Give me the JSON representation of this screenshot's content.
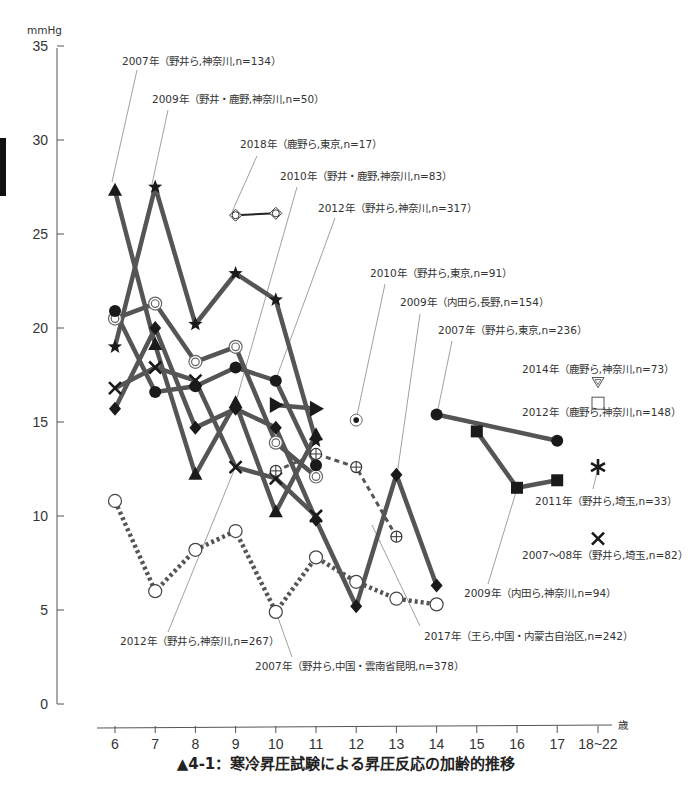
{
  "chart_data": {
    "type": "line",
    "title": "▲4-1：寒冷昇圧試験による昇圧反応の加齢的推移",
    "ylabel": "mmHg",
    "xlabel": "歳",
    "ylim": [
      0,
      35
    ],
    "yticks": [
      0,
      5,
      10,
      15,
      20,
      25,
      30,
      35
    ],
    "categories": [
      "6",
      "7",
      "8",
      "9",
      "10",
      "11",
      "12",
      "13",
      "14",
      "15",
      "16",
      "17",
      "18~22"
    ],
    "grid": false,
    "series": [
      {
        "name": "2007年（野井ら,神奈川,n=134）",
        "marker": "triangle",
        "style": "thick",
        "x": [
          6,
          7,
          8,
          9,
          10,
          11
        ],
        "values": [
          27.3,
          19.1,
          12.2,
          16.0,
          10.2,
          14.3
        ]
      },
      {
        "name": "2009年（野井・鹿野,神奈川,n=50）",
        "marker": "star",
        "style": "thick",
        "x": [
          6,
          7,
          8,
          9,
          10,
          11
        ],
        "values": [
          19.0,
          27.5,
          20.2,
          22.9,
          21.5,
          14.0
        ]
      },
      {
        "name": "2018年（鹿野ら,東京,n=17）",
        "marker": "diamond-open-cross",
        "style": "thin",
        "x": [
          9,
          10
        ],
        "values": [
          26.0,
          26.1
        ]
      },
      {
        "name": "2010年（野井・鹿野,神奈川,n=83）",
        "marker": "double-circle",
        "style": "thick",
        "x": [
          6,
          7,
          8,
          9,
          10,
          11
        ],
        "values": [
          20.5,
          21.3,
          18.2,
          19.0,
          13.9,
          12.1
        ]
      },
      {
        "name": "2012年（野井ら,神奈川,n=317）",
        "marker": "filled-circle",
        "style": "thick",
        "x": [
          6,
          7,
          8,
          9,
          10,
          11
        ],
        "values": [
          20.9,
          16.6,
          16.9,
          17.9,
          17.2,
          12.7
        ]
      },
      {
        "name": "2012年（野井ら,神奈川,n=267）",
        "marker": "x",
        "style": "thick",
        "x": [
          6,
          7,
          8,
          9,
          10,
          11
        ],
        "values": [
          16.8,
          17.9,
          17.2,
          12.6,
          12.0,
          10.0
        ]
      },
      {
        "name": "2009年（内田ら,長野,n=154）",
        "marker": "filled-diamond",
        "style": "thick",
        "x": [
          6,
          7,
          8,
          9,
          10,
          11,
          12,
          13,
          14
        ],
        "values": [
          15.7,
          20.0,
          14.7,
          15.7,
          14.7,
          9.8,
          5.2,
          12.2,
          6.3
        ]
      },
      {
        "name": "(unlabeled)",
        "marker": "right-triangle",
        "style": "thick",
        "x": [
          10,
          11
        ],
        "values": [
          15.9,
          15.7
        ]
      },
      {
        "name": "2010年（野井ら,東京,n=91）",
        "marker": "dot-in-circle",
        "style": "none",
        "x": [
          12
        ],
        "values": [
          15.1
        ]
      },
      {
        "name": "2017年（王ら,中国・内蒙古自治区,n=242）",
        "marker": "circle-plus",
        "style": "dashed",
        "x": [
          10,
          11,
          12,
          13
        ],
        "values": [
          12.4,
          13.3,
          12.6,
          8.9
        ]
      },
      {
        "name": "2007年（野井ら,中国・雲南省昆明,n=378）",
        "marker": "open-circle",
        "style": "dotted",
        "x": [
          6,
          7,
          8,
          9,
          10,
          11,
          12,
          13,
          14
        ],
        "values": [
          10.8,
          6.0,
          8.2,
          9.2,
          4.9,
          7.8,
          6.5,
          5.6,
          5.3
        ]
      },
      {
        "name": "2007年（野井ら,東京,n=236）",
        "marker": "filled-circle",
        "style": "thick",
        "x": [
          14,
          17
        ],
        "values": [
          15.4,
          14.0
        ]
      },
      {
        "name": "2009年（内田ら,神奈川,n=94）",
        "marker": "filled-square",
        "style": "thick",
        "x": [
          15,
          16,
          17
        ],
        "values": [
          14.5,
          11.5,
          11.9
        ]
      },
      {
        "name": "2014年（鹿野ら,神奈川,n=73）",
        "marker": "triangle-down-open",
        "style": "none",
        "x": [
          "18~22"
        ],
        "values": [
          17.1
        ]
      },
      {
        "name": "2012年（鹿野ら,神奈川,n=148）",
        "marker": "open-square",
        "style": "none",
        "x": [
          "18~22"
        ],
        "values": [
          16.0
        ]
      },
      {
        "name": "2011年（野井ら,埼玉,n=33）",
        "marker": "asterisk",
        "style": "none",
        "x": [
          "18~22"
        ],
        "values": [
          12.6
        ]
      },
      {
        "name": "2007～08年（野井ら,埼玉,n=82）",
        "marker": "x",
        "style": "none",
        "x": [
          "18~22"
        ],
        "values": [
          8.8
        ]
      }
    ]
  },
  "axis": {
    "y_unit": "mmHg",
    "x_unit": "歳",
    "y_ticks": [
      "0",
      "5",
      "10",
      "15",
      "20",
      "25",
      "30",
      "35"
    ],
    "x_ticks": [
      "6",
      "7",
      "8",
      "9",
      "10",
      "11",
      "12",
      "13",
      "14",
      "15",
      "16",
      "17",
      "18~22"
    ]
  },
  "annotations": [
    "2007年（野井ら,神奈川,n=134）",
    "2009年（野井・鹿野,神奈川,n=50）",
    "2018年（鹿野ら,東京,n=17）",
    "2010年（野井・鹿野,神奈川,n=83）",
    "2012年（野井ら,神奈川,n=317）",
    "2010年（野井ら,東京,n=91）",
    "2009年（内田ら,長野,n=154）",
    "2007年（野井ら,東京,n=236）",
    "2014年（鹿野ら,神奈川,n=73）",
    "2012年（鹿野ら,神奈川,n=148）",
    "2011年（野井ら,埼玉,n=33）",
    "2007～08年（野井ら,埼玉,n=82）",
    "2009年（内田ら,神奈川,n=94）",
    "2017年（王ら,中国・内蒙古自治区,n=242）",
    "2012年（野井ら,神奈川,n=267）",
    "2007年（野井ら,中国・雲南省昆明,n=378）"
  ],
  "caption": "▲4-1：寒冷昇圧試験による昇圧反応の加齢的推移",
  "colors": {
    "line": "#555555",
    "marker": "#1a1a1a",
    "axis": "#555555",
    "text": "#333333"
  }
}
